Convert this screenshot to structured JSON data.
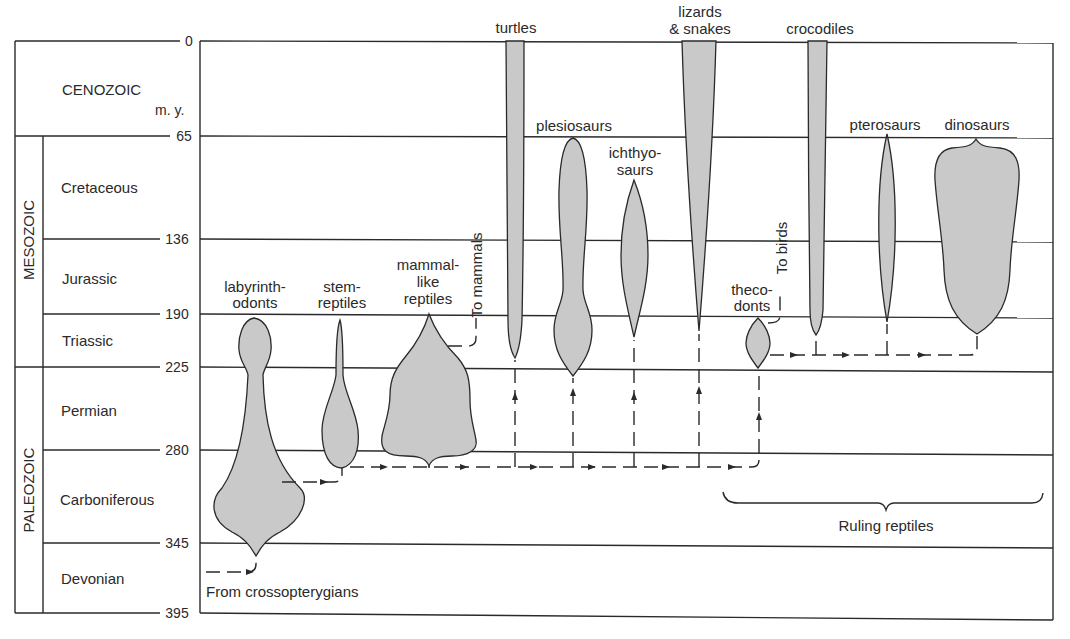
{
  "diagram": {
    "axis_unit": "m. y.",
    "time_ticks": [
      "0",
      "65",
      "136",
      "190",
      "225",
      "280",
      "345",
      "395"
    ],
    "eras": [
      "CENOZOIC",
      "MESOZOIC",
      "PALEOZOIC"
    ],
    "periods": [
      "Cretaceous",
      "Jurassic",
      "Triassic",
      "Permian",
      "Carboniferous",
      "Devonian"
    ],
    "groups": {
      "labyrinthodonts": [
        "labyrinth-",
        "odonts"
      ],
      "stem_reptiles": [
        "stem-",
        "reptiles"
      ],
      "mammal_like": [
        "mammal-",
        "like",
        "reptiles"
      ],
      "to_mammals": "To mammals",
      "turtles": "turtles",
      "plesiosaurs": "plesiosaurs",
      "ichthyosaurs": [
        "ichthyo-",
        "saurs"
      ],
      "lizards": [
        "lizards",
        "& snakes"
      ],
      "thecodonts": [
        "theco-",
        "donts"
      ],
      "to_birds": "To birds",
      "crocodiles": "crocodiles",
      "pterosaurs": "pterosaurs",
      "dinosaurs": "dinosaurs"
    },
    "origin_label": "From crossopterygians",
    "bracket_label": "Ruling reptiles",
    "colors": {
      "fill": "#c9c9c9",
      "ink": "#2a2a2a",
      "background": "#ffffff"
    }
  }
}
